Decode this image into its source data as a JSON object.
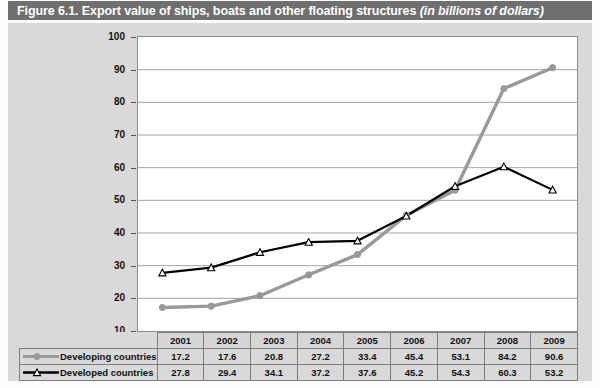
{
  "figure": {
    "title_main": "Figure 6.1. Export value of ships, boats and other floating structures ",
    "title_italic": "(in billions of dollars)"
  },
  "colors": {
    "title_bar": "#6f6f6f",
    "background": "#d9d9d9",
    "plot_background": "#ffffff",
    "developing": "#999999",
    "developed": "#000000",
    "gridline": "#9a9a9a",
    "border": "#8c8c8c"
  },
  "axis": {
    "y_ticks": [
      "100",
      "90",
      "80",
      "70",
      "60",
      "50",
      "40",
      "30",
      "20",
      "10"
    ],
    "y_min": 10,
    "y_max": 100
  },
  "table": {
    "row_label_developing": "Developing countries",
    "row_label_developed": "Developed countries",
    "years": [
      "2001",
      "2002",
      "2003",
      "2004",
      "2005",
      "2006",
      "2007",
      "2008",
      "2009"
    ],
    "developing": [
      "17.2",
      "17.6",
      "20.8",
      "27.2",
      "33.4",
      "45.4",
      "53.1",
      "84.2",
      "90.6"
    ],
    "developed": [
      "27.8",
      "29.4",
      "34.1",
      "37.2",
      "37.6",
      "45.2",
      "54.3",
      "60.3",
      "53.2"
    ]
  },
  "chart_data": {
    "type": "line",
    "title": "Figure 6.1. Export value of ships, boats and other floating structures (in billions of dollars)",
    "xlabel": "",
    "ylabel": "",
    "ylim": [
      10,
      100
    ],
    "grid": true,
    "legend_position": "bottom-table",
    "categories": [
      "2001",
      "2002",
      "2003",
      "2004",
      "2005",
      "2006",
      "2007",
      "2008",
      "2009"
    ],
    "series": [
      {
        "name": "Developing countries",
        "color": "#999999",
        "marker": "circle",
        "values": [
          17.2,
          17.6,
          20.8,
          27.2,
          33.4,
          45.4,
          53.1,
          84.2,
          90.6
        ]
      },
      {
        "name": "Developed countries",
        "color": "#000000",
        "marker": "triangle",
        "values": [
          27.8,
          29.4,
          34.1,
          37.2,
          37.6,
          45.2,
          54.3,
          60.3,
          53.2
        ]
      }
    ]
  }
}
